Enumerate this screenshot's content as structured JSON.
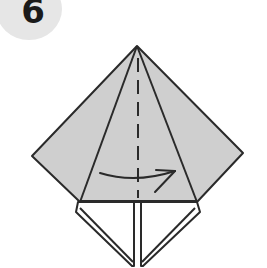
{
  "step": {
    "number": "6"
  },
  "colors": {
    "paper": "#cfcfcf",
    "line": "#2a2a2a",
    "badge": "#e6e6e6",
    "background": "#ffffff"
  }
}
